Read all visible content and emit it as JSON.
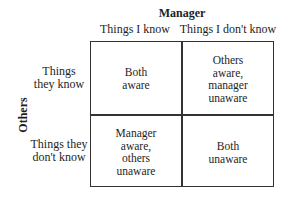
{
  "diagram": {
    "title": "Manager",
    "side_label": "Others",
    "columns": [
      "Things I know",
      "Things I don't know"
    ],
    "rows": [
      "Things\nthey know",
      "Things they\ndon't know"
    ],
    "cells": [
      [
        "Both\naware",
        "Others\naware,\nmanager\nunaware"
      ],
      [
        "Manager\naware,\nothers\nunaware",
        "Both\nunaware"
      ]
    ],
    "colors": {
      "line": "#333333",
      "text": "#1e1e1e",
      "background": "#ffffff"
    }
  }
}
